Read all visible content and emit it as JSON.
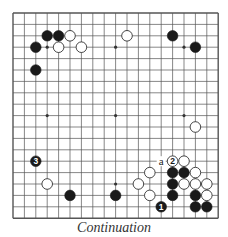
{
  "caption": "Continuation",
  "board": {
    "size": 19,
    "origin_x": 13,
    "origin_y": 13,
    "spacing": 11.4,
    "line_color": "#555555",
    "hoshi": [
      [
        3,
        3
      ],
      [
        9,
        3
      ],
      [
        15,
        3
      ],
      [
        3,
        9
      ],
      [
        9,
        9
      ],
      [
        15,
        9
      ],
      [
        3,
        15
      ],
      [
        9,
        15
      ],
      [
        15,
        15
      ]
    ],
    "stones": [
      {
        "color": "black",
        "col": 3,
        "row": 2
      },
      {
        "color": "black",
        "col": 4,
        "row": 2
      },
      {
        "color": "white",
        "col": 5,
        "row": 2
      },
      {
        "color": "black",
        "col": 2,
        "row": 3
      },
      {
        "color": "white",
        "col": 4,
        "row": 3
      },
      {
        "color": "white",
        "col": 6,
        "row": 3
      },
      {
        "color": "black",
        "col": 2,
        "row": 5
      },
      {
        "color": "white",
        "col": 10,
        "row": 2
      },
      {
        "color": "black",
        "col": 14,
        "row": 2
      },
      {
        "color": "black",
        "col": 16,
        "row": 3
      },
      {
        "color": "white",
        "col": 16,
        "row": 10
      },
      {
        "color": "black",
        "col": 2,
        "row": 13,
        "label": "3"
      },
      {
        "color": "white",
        "col": 14,
        "row": 13,
        "label": "2"
      },
      {
        "color": "white",
        "col": 15,
        "row": 13
      },
      {
        "color": "white",
        "col": 12,
        "row": 14
      },
      {
        "color": "black",
        "col": 14,
        "row": 14
      },
      {
        "color": "black",
        "col": 15,
        "row": 14
      },
      {
        "color": "white",
        "col": 16,
        "row": 14
      },
      {
        "color": "white",
        "col": 3,
        "row": 15
      },
      {
        "color": "white",
        "col": 11,
        "row": 15
      },
      {
        "color": "black",
        "col": 14,
        "row": 15
      },
      {
        "color": "white",
        "col": 15,
        "row": 15
      },
      {
        "color": "white",
        "col": 16,
        "row": 15
      },
      {
        "color": "white",
        "col": 17,
        "row": 15
      },
      {
        "color": "black",
        "col": 5,
        "row": 16
      },
      {
        "color": "black",
        "col": 9,
        "row": 16
      },
      {
        "color": "white",
        "col": 12,
        "row": 16
      },
      {
        "color": "black",
        "col": 14,
        "row": 16
      },
      {
        "color": "black",
        "col": 16,
        "row": 16
      },
      {
        "color": "white",
        "col": 17,
        "row": 16
      },
      {
        "color": "black",
        "col": 13,
        "row": 17,
        "label": "1"
      },
      {
        "color": "black",
        "col": 16,
        "row": 17
      },
      {
        "color": "black",
        "col": 17,
        "row": 17
      }
    ],
    "markers": [
      {
        "text": "a",
        "col": 13,
        "row": 13
      }
    ]
  }
}
